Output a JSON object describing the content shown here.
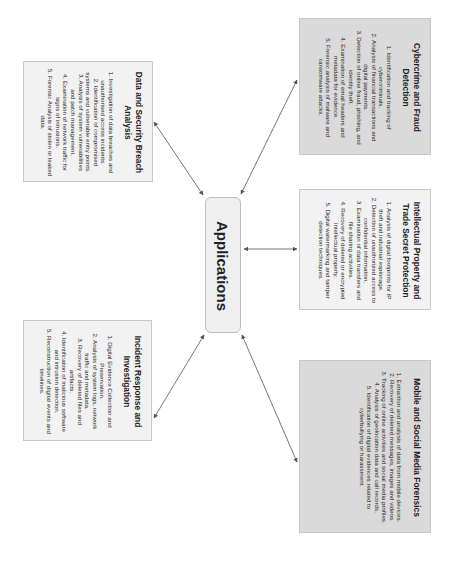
{
  "diagram": {
    "orientation": "rotated 90 degrees clockwise",
    "center": {
      "label": "Applications"
    },
    "nodes": [
      {
        "id": "data-security",
        "title": "Data and Security Breach Analysis",
        "items": [
          "1. Investigation of data breaches and unauthorised access incidents.",
          "2. Identification of compromised systems and vulnerable entry points.",
          "3. Analysis of system vulnerabilities and patch management.",
          "4. Examination of network traffic for signs of intrusions.",
          "5. Forensic Analysis of stolen or leaked data."
        ]
      },
      {
        "id": "cybercrime",
        "title": "Cybercrime and Fraud Detection",
        "items": [
          "1. Identification and tracking of cybercriminals.",
          "2. Analysis of financial transactions and digital payments.",
          "3. Detection of online fraud, phishing, and identity theft.",
          "4. Examination of email headers and metadata for evidence.",
          "5. Forensic analysis of malware and ransomware attacks."
        ]
      },
      {
        "id": "intellectual-property",
        "title": "Intellectual Property and Trade Secret Protection",
        "items": [
          "1. Analysis of digital footprints for IP theft and industrial espionage.",
          "2. Detection of unauthorized access to confidential information.",
          "3. Examination of data transfers and file sharing activities.",
          "4. Recovery of deleted or encrypted intellectual property.",
          "5. Digital watermarking and tamper detection techniques."
        ]
      },
      {
        "id": "incident-response",
        "title": "Incident Response and Investigation",
        "items": [
          "1. Digital Evidence Collection and Preservation.",
          "2. Analysis of system logs, network traffic and metadata.",
          "3. Recovery of deleted files and artifacts.",
          "4. Identification of malicious software and intrusion detection.",
          "5. Reconstruction of digital events and timelines."
        ]
      },
      {
        "id": "mobile-social",
        "title": "Mobile and Social Media Forensics",
        "items": [
          "1. Extraction and analysis of data from mobile devices.",
          "2. Recovery of deleted messages, images and videos.",
          "3. Tracking of online activities and social media profiles.",
          "4. Analysis of geolocation data and call records.",
          "5. Identification of digital evidences related to cyberbullying or harassment."
        ]
      }
    ],
    "edges": [
      {
        "from": "Applications",
        "to": "Data and Security Breach Analysis",
        "type": "bidirectional"
      },
      {
        "from": "Applications",
        "to": "Cybercrime and Fraud Detection",
        "type": "bidirectional"
      },
      {
        "from": "Applications",
        "to": "Intellectual Property and Trade Secret Protection",
        "type": "bidirectional"
      },
      {
        "from": "Applications",
        "to": "Incident Response and Investigation",
        "type": "bidirectional"
      },
      {
        "from": "Applications",
        "to": "Mobile and Social Media Forensics",
        "type": "bidirectional"
      }
    ],
    "colors": {
      "box_fill_light": "#f2f2f2",
      "box_fill_dark": "#dadada",
      "border": "#c8c8c8",
      "arrow": "#555555"
    }
  }
}
